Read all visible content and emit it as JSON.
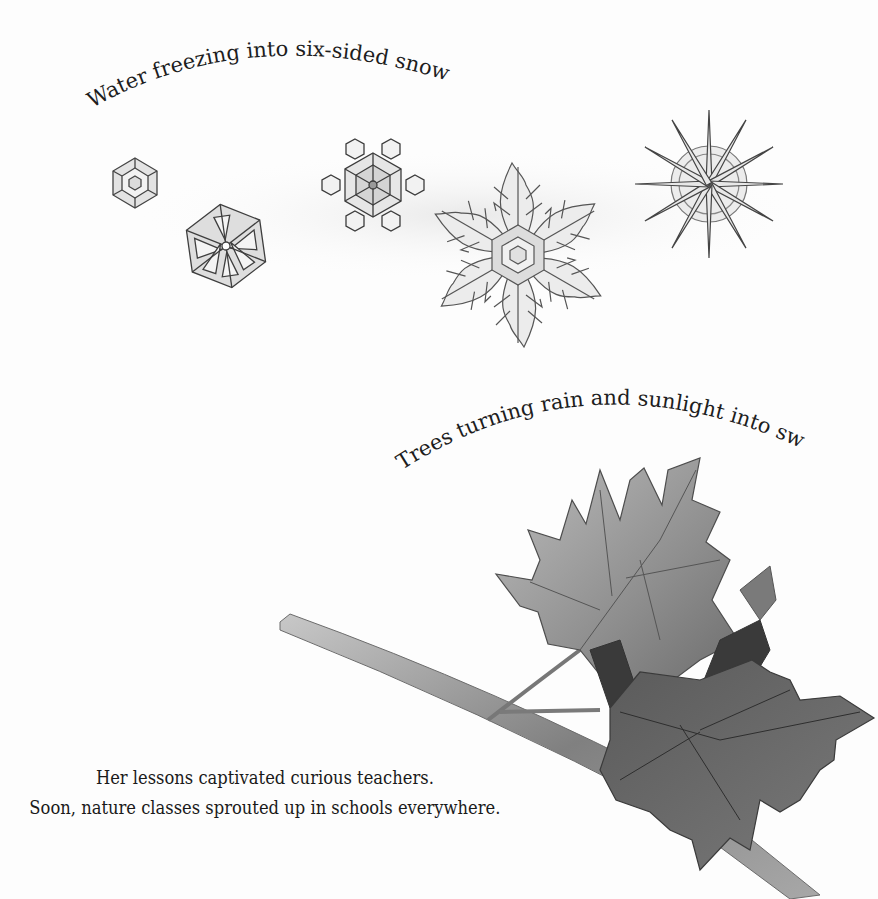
{
  "page": {
    "captions": {
      "snowflakes": "Water freezing into six-sided snowflakes.",
      "trees": "Trees turning rain and sunlight into sweet sap."
    },
    "body": {
      "line1": "Her lessons captivated curious teachers.",
      "line2": "Soon, nature classes sprouted up in schools everywhere."
    },
    "illustrations": {
      "snowflakes": [
        "hexagonal-plate",
        "sectored-plate",
        "stellar-plate-with-tips",
        "fernlike-dendrite",
        "needle-star"
      ],
      "branch": "maple-branch-with-leaves"
    },
    "colors": {
      "background": "#fdfdfd",
      "ink": "#1d1d1d",
      "pencil": "#555555",
      "leaf_light": "#9a9a9a",
      "leaf_dark": "#4a4a4a"
    }
  }
}
